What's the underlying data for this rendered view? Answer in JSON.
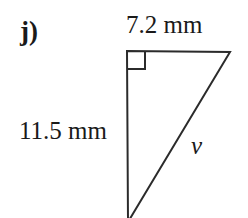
{
  "figure": {
    "part_label": "j)",
    "shape": "right-triangle",
    "labels": {
      "top_side": "7.2 mm",
      "left_side": "11.5 mm",
      "hypotenuse": "v"
    },
    "colors": {
      "stroke": "#2b2b2b",
      "text": "#1a1a1a",
      "background": "#ffffff"
    },
    "geometry": {
      "top_left_vertex": [
        127,
        51
      ],
      "top_right_vertex": [
        230,
        52
      ],
      "bottom_vertex": [
        128,
        222
      ],
      "right_angle_marker_size": 18,
      "right_angle_at": "top-left-vertex",
      "stroke_width": 2
    },
    "measurements": {
      "top_side_value": 7.2,
      "left_side_value": 11.5,
      "unit": "mm",
      "unknown_side": "v"
    }
  }
}
